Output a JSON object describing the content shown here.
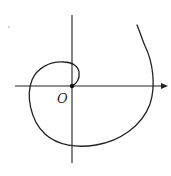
{
  "diagram": {
    "type": "spiral-curve-on-axes",
    "origin_label": "O",
    "colors": {
      "background": "#ffffff",
      "stroke": "#222222"
    },
    "axes": {
      "x_axis": {
        "has_arrow": true
      },
      "y_axis": {
        "has_arrow": false
      }
    },
    "curve": {
      "description": "Spiral starting at the origin, winding counterclockwise outward"
    }
  }
}
